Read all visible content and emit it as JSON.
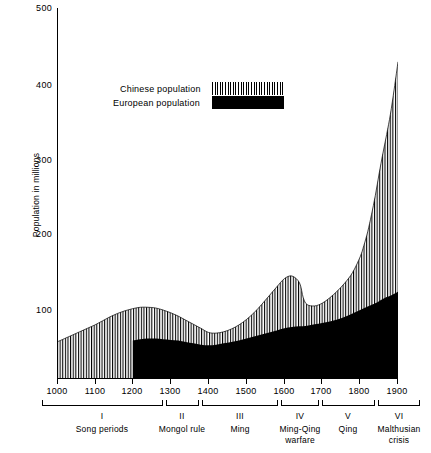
{
  "chart_data": {
    "type": "area",
    "title": "",
    "xlabel": "",
    "ylabel": "Population in millions",
    "xlim": [
      1000,
      1900
    ],
    "ylim": [
      0,
      500
    ],
    "grid": false,
    "legend_position": "upper-center",
    "xticks": [
      "1000",
      "1100",
      "1200",
      "1300",
      "1400",
      "1500",
      "1600",
      "1700",
      "1800",
      "1900"
    ],
    "yticks": [
      "100",
      "200",
      "300",
      "400",
      "500"
    ],
    "series": [
      {
        "name": "Chinese population",
        "style": "vertical-hatch",
        "color": "#000000",
        "x": [
          1000,
          1020,
          1040,
          1060,
          1080,
          1100,
          1120,
          1140,
          1160,
          1180,
          1200,
          1220,
          1240,
          1260,
          1280,
          1300,
          1320,
          1340,
          1360,
          1380,
          1400,
          1420,
          1440,
          1460,
          1480,
          1500,
          1520,
          1540,
          1560,
          1580,
          1600,
          1620,
          1640,
          1650,
          1660,
          1680,
          1700,
          1720,
          1740,
          1760,
          1780,
          1800,
          1810,
          1820,
          1830,
          1840,
          1850,
          1860,
          1870,
          1880,
          1890,
          1900
        ],
        "values": [
          53,
          58,
          63,
          68,
          73,
          78,
          84,
          90,
          95,
          99,
          102,
          104,
          104,
          103,
          100,
          96,
          91,
          85,
          79,
          73,
          67,
          66,
          68,
          72,
          78,
          86,
          96,
          108,
          121,
          134,
          146,
          150,
          140,
          118,
          108,
          106,
          110,
          118,
          128,
          140,
          155,
          178,
          195,
          215,
          240,
          268,
          300,
          330,
          358,
          388,
          425,
          465
        ]
      },
      {
        "name": "European population",
        "style": "solid-fill",
        "color": "#000000",
        "x": [
          1200,
          1220,
          1240,
          1260,
          1280,
          1300,
          1320,
          1340,
          1360,
          1380,
          1400,
          1420,
          1440,
          1460,
          1480,
          1500,
          1520,
          1540,
          1560,
          1580,
          1600,
          1620,
          1640,
          1660,
          1680,
          1700,
          1720,
          1740,
          1760,
          1780,
          1800,
          1820,
          1840,
          1850,
          1860,
          1870,
          1880,
          1890,
          1900
        ],
        "values": [
          55,
          57,
          58,
          58,
          57,
          56,
          55,
          53,
          51,
          49,
          48,
          49,
          51,
          53,
          55,
          58,
          61,
          64,
          67,
          70,
          73,
          75,
          76,
          77,
          79,
          81,
          83,
          86,
          90,
          95,
          100,
          105,
          110,
          113,
          116,
          119,
          121,
          124,
          127
        ]
      }
    ],
    "annotations": {
      "note": "Chinese population drawn as total height from zero with vertical hatching; European population drawn as solid black area beneath, beginning at year 1200."
    }
  },
  "legend": {
    "items": [
      {
        "label": "Chinese population",
        "swatch": "vertical-hatch"
      },
      {
        "label": "European population",
        "swatch": "solid-black"
      }
    ]
  },
  "periods": [
    {
      "roman": "I",
      "label": "Song periods",
      "start": 1000,
      "end": 1280
    },
    {
      "roman": "II",
      "label": "Mongol rule",
      "start": 1290,
      "end": 1375
    },
    {
      "roman": "III",
      "label": "Ming",
      "start": 1382,
      "end": 1585
    },
    {
      "roman": "IV",
      "label": "Ming-Qing\nwarfare",
      "start": 1592,
      "end": 1700
    },
    {
      "roman": "V",
      "label": "Qing",
      "start": 1707,
      "end": 1850
    },
    {
      "roman": "VI",
      "label": "Malthusian\ncrisis",
      "start": 1857,
      "end": 1905
    }
  ],
  "period_labels": {
    "p1_roman": "I",
    "p1_text": "Song periods",
    "p2_roman": "II",
    "p2_text": "Mongol rule",
    "p3_roman": "III",
    "p3_text": "Ming",
    "p4_roman": "IV",
    "p4_text": "Ming-Qing",
    "p4_text2": "warfare",
    "p5_roman": "V",
    "p5_text": "Qing",
    "p6_roman": "VI",
    "p6_text": "Malthusian",
    "p6_text2": "crisis"
  },
  "axis": {
    "y_title": "Population in millions",
    "y_500": "500",
    "y_400": "400",
    "y_300": "300",
    "y_200": "200",
    "y_100": "100",
    "x_1000": "1000",
    "x_1100": "1100",
    "x_1200": "1200",
    "x_1300": "1300",
    "x_1400": "1400",
    "x_1500": "1500",
    "x_1600": "1600",
    "x_1700": "1700",
    "x_1800": "1800",
    "x_1900": "1900"
  }
}
